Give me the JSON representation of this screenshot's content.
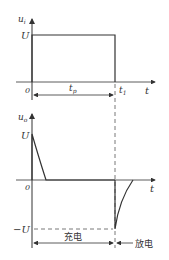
{
  "diagram": {
    "top_plot": {
      "y_axis_label": "u",
      "y_axis_sub": "i",
      "x_axis_label": "t",
      "level_label": "U",
      "origin_label": "0",
      "t1_label": "t",
      "t1_sub": "1",
      "tp_label": "t",
      "tp_sub": "p"
    },
    "bottom_plot": {
      "y_axis_label": "u",
      "y_axis_sub": "o",
      "x_axis_label": "t",
      "pos_level_label": "U",
      "neg_level_label": "−U",
      "origin_label": "0",
      "charge_label": "充电",
      "discharge_label": "放电"
    },
    "colors": {
      "line": "#333333",
      "dashed": "#555555"
    }
  }
}
